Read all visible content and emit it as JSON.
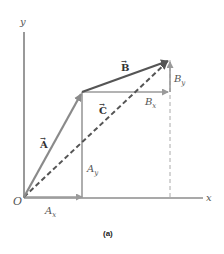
{
  "figure": {
    "caption": "(a)",
    "axes": {
      "x_label": "x",
      "y_label": "y",
      "origin_label": "O"
    },
    "vectors": {
      "A": {
        "label": "A",
        "arrow": "→"
      },
      "B": {
        "label": "B",
        "arrow": "→"
      },
      "C": {
        "label": "C",
        "arrow": "→"
      }
    },
    "components": {
      "Ax": {
        "base": "A",
        "sub": "x"
      },
      "Ay": {
        "base": "A",
        "sub": "y"
      },
      "Bx": {
        "base": "B",
        "sub": "x"
      },
      "By": {
        "base": "B",
        "sub": "y"
      }
    },
    "colors": {
      "axis": "#555555",
      "vector_main": "#6e6e6e",
      "vector_B": "#555555",
      "component": "#9a9a9a",
      "resultant_dashed": "#555555",
      "guide_dashed": "#aaaaaa"
    }
  }
}
